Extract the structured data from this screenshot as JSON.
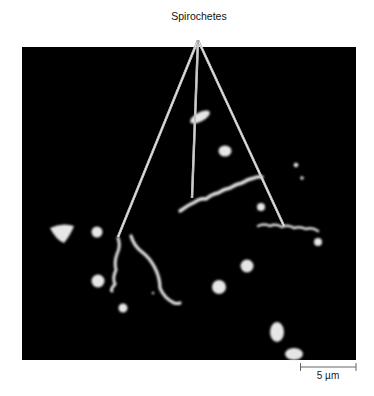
{
  "figure": {
    "annotation_label": "Spirochetes",
    "scale_bar_label": "5 µm",
    "background_color": "#000000",
    "cell_color": "#e6e6e6",
    "pointer_line_color": "#bdbdbd"
  }
}
